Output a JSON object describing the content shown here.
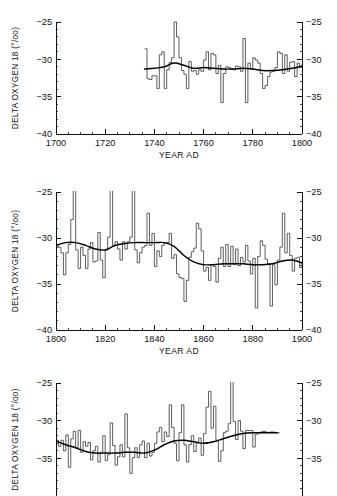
{
  "figure": {
    "ylabel": "DELTA OXYGEN 18 (°/oo)",
    "xlabel": "YEAR AD"
  },
  "chart_data": [
    {
      "type": "line",
      "title": "",
      "xlabel": "YEAR AD",
      "ylabel": "DELTA OXYGEN 18 (°/oo)",
      "xlim": [
        1700,
        1800
      ],
      "ylim": [
        -40,
        -25
      ],
      "xticks": [
        1700,
        1720,
        1740,
        1760,
        1780,
        1800
      ],
      "yticks": [
        -25,
        -30,
        -35,
        -40
      ],
      "minor_x_interval": 5,
      "minor_y_interval": 1,
      "grid": false,
      "legend": "none",
      "mirrored_y_axis": true,
      "series": [
        {
          "name": "annual delta O-18",
          "style": "step",
          "x": [
            1736,
            1737,
            1738,
            1739,
            1740,
            1741,
            1742,
            1743,
            1744,
            1745,
            1746,
            1747,
            1748,
            1749,
            1750,
            1751,
            1752,
            1753,
            1754,
            1755,
            1756,
            1757,
            1758,
            1759,
            1760,
            1761,
            1762,
            1763,
            1764,
            1765,
            1766,
            1767,
            1768,
            1769,
            1770,
            1771,
            1772,
            1773,
            1774,
            1775,
            1776,
            1777,
            1778,
            1779,
            1780,
            1781,
            1782,
            1783,
            1784,
            1785,
            1786,
            1787,
            1788,
            1789,
            1790,
            1791,
            1792,
            1793,
            1794,
            1795,
            1796,
            1797,
            1798,
            1799,
            1800
          ],
          "values": [
            -28.6,
            -32.6,
            -32.7,
            -32.2,
            -32.2,
            -33.9,
            -29.4,
            -29.0,
            -33.9,
            -31.4,
            -30.4,
            -29.8,
            -25.0,
            -27.0,
            -29.8,
            -31.5,
            -32.0,
            -33.9,
            -30.3,
            -31.6,
            -31.5,
            -32.0,
            -31.4,
            -31.6,
            -30.1,
            -29.0,
            -31.4,
            -29.2,
            -29.4,
            -31.9,
            -30.8,
            -35.8,
            -31.9,
            -31.0,
            -31.1,
            -31.3,
            -31.4,
            -30.9,
            -31.0,
            -31.6,
            -27.2,
            -35.8,
            -30.5,
            -31.3,
            -29.8,
            -30.1,
            -30.5,
            -31.9,
            -33.9,
            -33.5,
            -32.3,
            -31.7,
            -31.6,
            -31.1,
            -29.0,
            -29.2,
            -31.9,
            -29.4,
            -31.6,
            -30.4,
            -30.3,
            -32.3,
            -30.5,
            -31.1,
            -30.7
          ]
        },
        {
          "name": "smoothed running mean",
          "style": "smooth",
          "x": [
            1736,
            1740,
            1744,
            1748,
            1752,
            1756,
            1760,
            1764,
            1768,
            1772,
            1776,
            1780,
            1784,
            1788,
            1792,
            1796,
            1800
          ],
          "values": [
            -31.3,
            -31.2,
            -31.0,
            -30.5,
            -30.8,
            -31.2,
            -31.1,
            -31.2,
            -31.3,
            -31.3,
            -31.2,
            -31.3,
            -31.5,
            -31.5,
            -31.4,
            -31.2,
            -30.9
          ]
        }
      ]
    },
    {
      "type": "line",
      "title": "",
      "xlabel": "YEAR AD",
      "ylabel": "DELTA OXYGEN 18 (°/oo)",
      "xlim": [
        1800,
        1900
      ],
      "ylim": [
        -40,
        -25
      ],
      "xticks": [
        1800,
        1820,
        1840,
        1860,
        1880,
        1900
      ],
      "yticks": [
        -25,
        -30,
        -35,
        -40
      ],
      "minor_x_interval": 5,
      "minor_y_interval": 1,
      "grid": false,
      "legend": "none",
      "mirrored_y_axis": true,
      "series": [
        {
          "name": "annual delta O-18",
          "style": "step",
          "x": [
            1800,
            1801,
            1802,
            1803,
            1804,
            1805,
            1806,
            1807,
            1808,
            1809,
            1810,
            1811,
            1812,
            1813,
            1814,
            1815,
            1816,
            1817,
            1818,
            1819,
            1820,
            1821,
            1822,
            1823,
            1824,
            1825,
            1826,
            1827,
            1828,
            1829,
            1830,
            1831,
            1832,
            1833,
            1834,
            1835,
            1836,
            1837,
            1838,
            1839,
            1840,
            1841,
            1842,
            1843,
            1844,
            1845,
            1846,
            1847,
            1848,
            1849,
            1850,
            1851,
            1852,
            1853,
            1854,
            1855,
            1856,
            1857,
            1858,
            1859,
            1860,
            1861,
            1862,
            1863,
            1864,
            1865,
            1866,
            1867,
            1868,
            1869,
            1870,
            1871,
            1872,
            1873,
            1874,
            1875,
            1876,
            1877,
            1878,
            1879,
            1880,
            1881,
            1882,
            1883,
            1884,
            1885,
            1886,
            1887,
            1888,
            1889,
            1890,
            1891,
            1892,
            1893,
            1894,
            1895,
            1896,
            1897,
            1898,
            1899,
            1900
          ],
          "values": [
            -30.8,
            -31.0,
            -31.6,
            -34.0,
            -31.6,
            -30.7,
            -28.0,
            -24.3,
            -31.3,
            -33.3,
            -31.0,
            -31.9,
            -33.3,
            -31.2,
            -30.5,
            -32.6,
            -32.5,
            -29.4,
            -32.4,
            -34.3,
            -31.3,
            -29.9,
            -24.3,
            -30.9,
            -30.4,
            -31.2,
            -32.4,
            -30.4,
            -31.2,
            -30.4,
            -29.9,
            -24.8,
            -31.3,
            -32.7,
            -31.6,
            -31.0,
            -30.8,
            -27.3,
            -30.8,
            -29.5,
            -33.1,
            -31.4,
            -32.0,
            -30.8,
            -30.5,
            -30.5,
            -29.5,
            -32.2,
            -31.8,
            -33.9,
            -34.3,
            -34.4,
            -36.9,
            -34.6,
            -32.1,
            -31.5,
            -31.1,
            -28.4,
            -29.0,
            -31.4,
            -33.6,
            -33.2,
            -34.6,
            -32.9,
            -33.1,
            -34.8,
            -32.2,
            -31.0,
            -33.1,
            -30.7,
            -33.1,
            -30.9,
            -32.9,
            -31.2,
            -33.0,
            -32.1,
            -32.6,
            -30.8,
            -32.5,
            -33.9,
            -32.2,
            -37.6,
            -32.0,
            -30.3,
            -30.8,
            -32.3,
            -32.8,
            -37.4,
            -32.9,
            -35.1,
            -32.4,
            -31.0,
            -27.3,
            -31.6,
            -29.5,
            -31.9,
            -33.6,
            -32.2,
            -32.1,
            -33.2,
            -32.6
          ]
        },
        {
          "name": "smoothed running mean",
          "style": "smooth",
          "x": [
            1800,
            1804,
            1808,
            1812,
            1816,
            1820,
            1824,
            1828,
            1832,
            1836,
            1840,
            1844,
            1848,
            1852,
            1856,
            1860,
            1864,
            1868,
            1872,
            1876,
            1880,
            1884,
            1888,
            1892,
            1896,
            1900
          ],
          "values": [
            -30.8,
            -30.5,
            -30.5,
            -30.8,
            -31.2,
            -31.3,
            -30.8,
            -30.6,
            -30.5,
            -30.5,
            -30.5,
            -30.5,
            -30.9,
            -31.9,
            -32.6,
            -32.9,
            -32.9,
            -32.8,
            -32.8,
            -32.8,
            -32.9,
            -32.9,
            -32.8,
            -32.5,
            -32.4,
            -32.7
          ]
        }
      ]
    },
    {
      "type": "line",
      "title": "",
      "xlabel": "YEAR AD",
      "ylabel": "DELTA OXYGEN 18 (°/oo)",
      "xlim": [
        1900,
        2000
      ],
      "ylim": [
        -40,
        -25
      ],
      "xticks": [
        1900,
        1920,
        1940,
        1960,
        1980,
        2000
      ],
      "yticks": [
        -25,
        -30,
        -35
      ],
      "minor_x_interval": 5,
      "minor_y_interval": 1,
      "grid": false,
      "legend": "none",
      "mirrored_y_axis": true,
      "clipped_at_bottom": true,
      "series": [
        {
          "name": "annual delta O-18",
          "style": "step",
          "x": [
            1900,
            1901,
            1902,
            1903,
            1904,
            1905,
            1906,
            1907,
            1908,
            1909,
            1910,
            1911,
            1912,
            1913,
            1914,
            1915,
            1916,
            1917,
            1918,
            1919,
            1920,
            1921,
            1922,
            1923,
            1924,
            1925,
            1926,
            1927,
            1928,
            1929,
            1930,
            1931,
            1932,
            1933,
            1934,
            1935,
            1936,
            1937,
            1938,
            1939,
            1940,
            1941,
            1942,
            1943,
            1944,
            1945,
            1946,
            1947,
            1948,
            1949,
            1950,
            1951,
            1952,
            1953,
            1954,
            1955,
            1956,
            1957,
            1958,
            1959,
            1960,
            1961,
            1962,
            1963,
            1964,
            1965,
            1966,
            1967,
            1968,
            1969,
            1970,
            1971,
            1972,
            1973,
            1974,
            1975,
            1976,
            1977,
            1978,
            1979,
            1980,
            1981,
            1982,
            1983,
            1984,
            1985,
            1986,
            1987,
            1988,
            1989,
            1990
          ],
          "values": [
            -32.6,
            -33.4,
            -32.6,
            -34.0,
            -31.9,
            -36.2,
            -32.4,
            -31.4,
            -33.6,
            -31.3,
            -34.2,
            -32.8,
            -33.4,
            -32.9,
            -35.2,
            -34.0,
            -33.4,
            -35.5,
            -34.2,
            -32.0,
            -35.3,
            -34.5,
            -30.3,
            -33.3,
            -35.9,
            -34.8,
            -33.2,
            -34.8,
            -29.1,
            -33.6,
            -37.0,
            -34.9,
            -33.6,
            -34.9,
            -33.2,
            -32.7,
            -34.9,
            -33.0,
            -34.7,
            -34.2,
            -33.0,
            -31.5,
            -30.9,
            -32.8,
            -31.5,
            -32.1,
            -27.9,
            -30.9,
            -33.0,
            -35.3,
            -31.6,
            -27.9,
            -33.2,
            -35.5,
            -33.2,
            -32.0,
            -34.1,
            -33.0,
            -32.3,
            -34.6,
            -31.7,
            -28.2,
            -26.1,
            -31.0,
            -28.1,
            -32.6,
            -35.4,
            -34.0,
            -31.6,
            -31.4,
            -30.4,
            -24.5,
            -30.1,
            -32.5,
            -30.0,
            -31.4,
            -33.7,
            -31.3,
            -31.3,
            -31.3,
            -33.5,
            -31.8,
            -31.6,
            -31.5,
            -31.4,
            -31.5,
            -31.6,
            -31.5,
            -31.5,
            -31.6,
            -31.6
          ]
        },
        {
          "name": "smoothed running mean",
          "style": "smooth",
          "x": [
            1900,
            1904,
            1908,
            1912,
            1916,
            1920,
            1924,
            1928,
            1932,
            1936,
            1940,
            1944,
            1948,
            1952,
            1956,
            1960,
            1964,
            1968,
            1972,
            1976,
            1980,
            1984,
            1988,
            1990
          ],
          "values": [
            -32.7,
            -33.2,
            -33.6,
            -34.1,
            -34.3,
            -34.3,
            -34.3,
            -34.2,
            -34.2,
            -34.3,
            -33.9,
            -33.2,
            -32.7,
            -32.6,
            -32.8,
            -33.0,
            -32.8,
            -32.4,
            -32.0,
            -31.7,
            -31.6,
            -31.6,
            -31.6,
            -31.6
          ]
        }
      ]
    }
  ]
}
